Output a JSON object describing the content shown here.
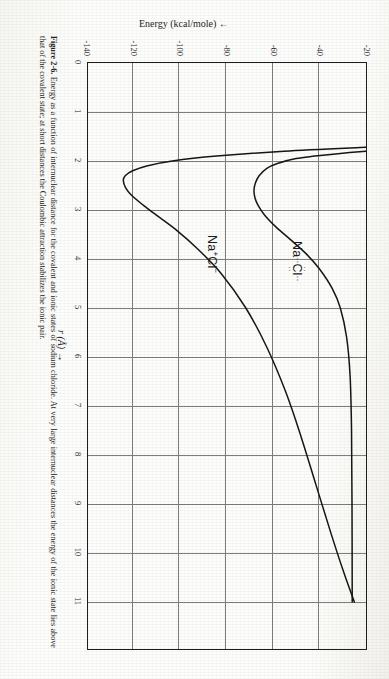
{
  "figure": {
    "caption_number": "Figure 2-6.",
    "caption_text": "Energy as a function of internuclear distance for the covalent and ionic states of sodium chloride. At very large internuclear distances the energy of the ionic state lies above that of the covalent state; at short distances the Coulombic attraction stabilizes the ionic pair."
  },
  "axes": {
    "x": {
      "title": "r (Å) →",
      "symbol": "r",
      "unit": "Å",
      "arrow": "→",
      "min": 0,
      "max": 11,
      "ticks": [
        "0",
        "1",
        "2",
        "3",
        "4",
        "5",
        "6",
        "7",
        "8",
        "9",
        "10",
        "11"
      ]
    },
    "y": {
      "title": "Energy (kcal/mole) ←",
      "label": "Energy",
      "unit": "kcal/mole",
      "arrow": "←",
      "min": -140,
      "max": -20,
      "ticks": [
        "-20",
        "-40",
        "-60",
        "-80",
        "-100",
        "-120",
        "-140"
      ]
    }
  },
  "curves": {
    "covalent": {
      "label_prefix": "Na",
      "label_atom": "Cl",
      "label_dots_top": "··",
      "label_dots_bottom": "··",
      "label_dots_left": "··",
      "label_dots_right": "··",
      "label_plain": "Na :Cl:",
      "color": "#161616"
    },
    "ionic": {
      "label_base1": "Na",
      "label_sup1": "+",
      "label_base2": "Cl",
      "label_sup2": "−",
      "label_plain": "Na⁺Cl⁻",
      "color": "#161616"
    }
  },
  "colors": {
    "paper": "#fdfdfb",
    "ink": "#161616",
    "grid": "#7d7d7d",
    "frame": "#1d1d1d"
  },
  "chart_data": {
    "type": "line",
    "title": "",
    "xlabel": "r (Å) →",
    "ylabel": "Energy (kcal/mole) ←",
    "xlim": [
      0,
      11
    ],
    "ylim": [
      -140,
      -20
    ],
    "grid": true,
    "legend": "inline-labels",
    "x_ticks": [
      0,
      1,
      2,
      3,
      4,
      5,
      6,
      7,
      8,
      9,
      10,
      11
    ],
    "y_ticks": [
      -20,
      -40,
      -60,
      -80,
      -100,
      -120,
      -140
    ],
    "series": [
      {
        "name": "Na :Cl: (covalent)",
        "annotation": "Na :Cl:",
        "minimum": {
          "r": 2.6,
          "energy": -68
        },
        "asymptote": -26,
        "points": [
          [
            1.8,
            -20
          ],
          [
            1.85,
            -32
          ],
          [
            1.9,
            -42
          ],
          [
            1.95,
            -50
          ],
          [
            2.05,
            -58
          ],
          [
            2.15,
            -62.5
          ],
          [
            2.3,
            -65.8
          ],
          [
            2.45,
            -67.4
          ],
          [
            2.6,
            -68.0
          ],
          [
            2.75,
            -67.6
          ],
          [
            2.9,
            -66.3
          ],
          [
            3.1,
            -63.5
          ],
          [
            3.35,
            -58.5
          ],
          [
            3.6,
            -52.5
          ],
          [
            3.9,
            -45.5
          ],
          [
            4.2,
            -40.0
          ],
          [
            4.6,
            -34.5
          ],
          [
            5.0,
            -31.0
          ],
          [
            5.6,
            -28.3
          ],
          [
            6.4,
            -26.8
          ],
          [
            7.5,
            -26.2
          ],
          [
            9.0,
            -26.0
          ],
          [
            11.0,
            -25.9
          ]
        ]
      },
      {
        "name": "Na+Cl- (ionic)",
        "annotation": "Na⁺Cl⁻",
        "minimum": {
          "r": 2.4,
          "energy": -124
        },
        "points": [
          [
            1.72,
            -20
          ],
          [
            1.8,
            -55
          ],
          [
            1.9,
            -84
          ],
          [
            2.0,
            -103
          ],
          [
            2.1,
            -114
          ],
          [
            2.2,
            -120
          ],
          [
            2.3,
            -123.2
          ],
          [
            2.4,
            -124.0
          ],
          [
            2.55,
            -123.0
          ],
          [
            2.7,
            -120.5
          ],
          [
            2.9,
            -115.5
          ],
          [
            3.1,
            -110.0
          ],
          [
            3.4,
            -101.5
          ],
          [
            3.8,
            -92.0
          ],
          [
            4.3,
            -82.0
          ],
          [
            5.0,
            -71.5
          ],
          [
            5.8,
            -62.5
          ],
          [
            6.7,
            -54.5
          ],
          [
            7.6,
            -48.0
          ],
          [
            8.6,
            -41.5
          ],
          [
            9.6,
            -35.0
          ],
          [
            10.4,
            -29.5
          ],
          [
            11.0,
            -25.0
          ]
        ]
      }
    ]
  }
}
